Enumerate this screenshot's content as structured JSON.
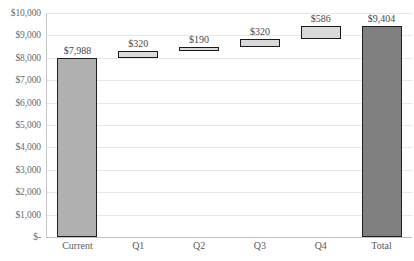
{
  "chart_data": {
    "type": "bar",
    "subtype": "waterfall",
    "title": "",
    "xlabel": "",
    "ylabel": "",
    "categories": [
      "Current",
      "Q1",
      "Q2",
      "Q3",
      "Q4",
      "Total"
    ],
    "values": [
      7988,
      320,
      190,
      320,
      586,
      9404
    ],
    "bases": [
      0,
      7988,
      8308,
      8498,
      8818,
      0
    ],
    "kinds": [
      "total",
      "delta",
      "delta",
      "delta",
      "delta",
      "total"
    ],
    "data_labels": [
      "$7,988",
      "$320",
      "$190",
      "$320",
      "$586",
      "$9,404"
    ],
    "ylim": [
      0,
      10000
    ],
    "ytick_values": [
      0,
      1000,
      2000,
      3000,
      4000,
      5000,
      6000,
      7000,
      8000,
      9000,
      10000
    ],
    "ytick_labels": [
      "$-",
      "$1,000",
      "$2,000",
      "$3,000",
      "$4,000",
      "$5,000",
      "$6,000",
      "$7,000",
      "$8,000",
      "$9,000",
      "$10,000"
    ],
    "grid": true,
    "legend": false,
    "colors": {
      "start_bar_fill": "#b0b0b0",
      "total_bar_fill": "#808080",
      "delta_bar_fill": "#d9d9d9",
      "bar_border": "#1f1f1f",
      "gridline": "#e8e8e8",
      "axis_text": "#5a5a5a",
      "label_text": "#4a4a4a",
      "plot_background": "#ffffff"
    }
  }
}
